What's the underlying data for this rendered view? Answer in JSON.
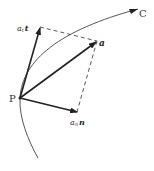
{
  "diagram": {
    "type": "vector-decomposition",
    "point_label": "P",
    "curve_label": "C",
    "vectors": [
      {
        "id": "tangential",
        "coef": "a",
        "coef_sub": "t",
        "unit": "t"
      },
      {
        "id": "acceleration",
        "symbol": "a"
      },
      {
        "id": "normal",
        "coef": "a",
        "coef_sub": "n",
        "unit": "n"
      }
    ],
    "colors": {
      "stroke": "#222222",
      "curve": "#555555",
      "dashed": "#444444",
      "background": "#ffffff"
    }
  }
}
